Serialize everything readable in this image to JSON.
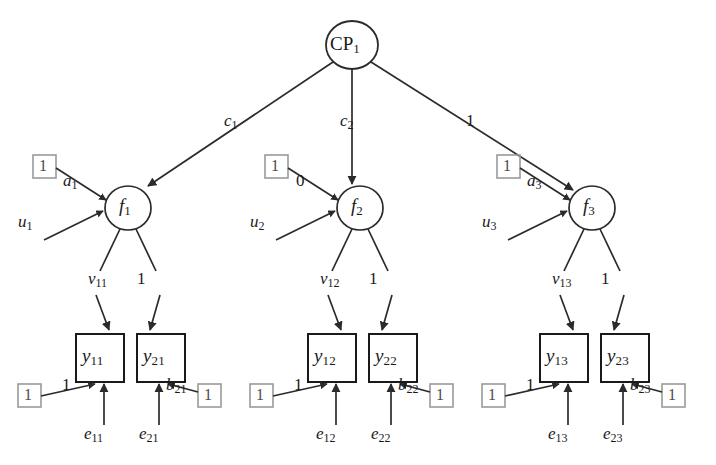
{
  "diagram": {
    "colors": {
      "line": "#2b2b2b",
      "box_black": "#1a1a1a",
      "box_gray": "#9a9a9a",
      "text": "#1a1a1a",
      "background": "#ffffff"
    },
    "top_node": {
      "name": "CP1",
      "base": "CP",
      "sub": "1",
      "shape": "circle"
    },
    "top_paths": [
      {
        "name": "c1",
        "base": "c",
        "sub": "1",
        "target": "f1"
      },
      {
        "name": "c2",
        "base": "c",
        "sub": "2",
        "target": "f2"
      },
      {
        "name": "one",
        "base": "1",
        "sub": "",
        "target": "f3"
      }
    ],
    "factors": [
      {
        "name": "f1",
        "base": "f",
        "sub": "1",
        "const_box": "1",
        "const_path": {
          "base": "a",
          "sub": "1"
        },
        "disturbance": {
          "base": "u",
          "sub": "1"
        },
        "loadings": [
          {
            "base": "v",
            "sub": "11"
          },
          {
            "base": "1",
            "sub": ""
          }
        ],
        "indicators": [
          {
            "base": "y",
            "sub": "11",
            "residual": {
              "base": "e",
              "sub": "11"
            },
            "const_box": "1",
            "const_path": {
              "base": "1",
              "sub": ""
            },
            "side": "left"
          },
          {
            "base": "y",
            "sub": "21",
            "residual": {
              "base": "e",
              "sub": "21"
            },
            "const_box": "1",
            "const_path": {
              "base": "b",
              "sub": "21"
            },
            "side": "right"
          }
        ]
      },
      {
        "name": "f2",
        "base": "f",
        "sub": "2",
        "const_box": "1",
        "const_path": {
          "base": "0",
          "sub": ""
        },
        "disturbance": {
          "base": "u",
          "sub": "2"
        },
        "loadings": [
          {
            "base": "v",
            "sub": "12"
          },
          {
            "base": "1",
            "sub": ""
          }
        ],
        "indicators": [
          {
            "base": "y",
            "sub": "12",
            "residual": {
              "base": "e",
              "sub": "12"
            },
            "const_box": "1",
            "const_path": {
              "base": "1",
              "sub": ""
            },
            "side": "left"
          },
          {
            "base": "y",
            "sub": "22",
            "residual": {
              "base": "e",
              "sub": "22"
            },
            "const_box": "1",
            "const_path": {
              "base": "b",
              "sub": "22"
            },
            "side": "right"
          }
        ]
      },
      {
        "name": "f3",
        "base": "f",
        "sub": "3",
        "const_box": "1",
        "const_path": {
          "base": "a",
          "sub": "3"
        },
        "disturbance": {
          "base": "u",
          "sub": "3"
        },
        "loadings": [
          {
            "base": "v",
            "sub": "13"
          },
          {
            "base": "1",
            "sub": ""
          }
        ],
        "indicators": [
          {
            "base": "y",
            "sub": "13",
            "residual": {
              "base": "e",
              "sub": "13"
            },
            "const_box": "1",
            "const_path": {
              "base": "1",
              "sub": ""
            },
            "side": "left"
          },
          {
            "base": "y",
            "sub": "23",
            "residual": {
              "base": "e",
              "sub": "23"
            },
            "const_box": "1",
            "const_path": {
              "base": "b",
              "sub": "23"
            },
            "side": "right"
          }
        ]
      }
    ]
  }
}
